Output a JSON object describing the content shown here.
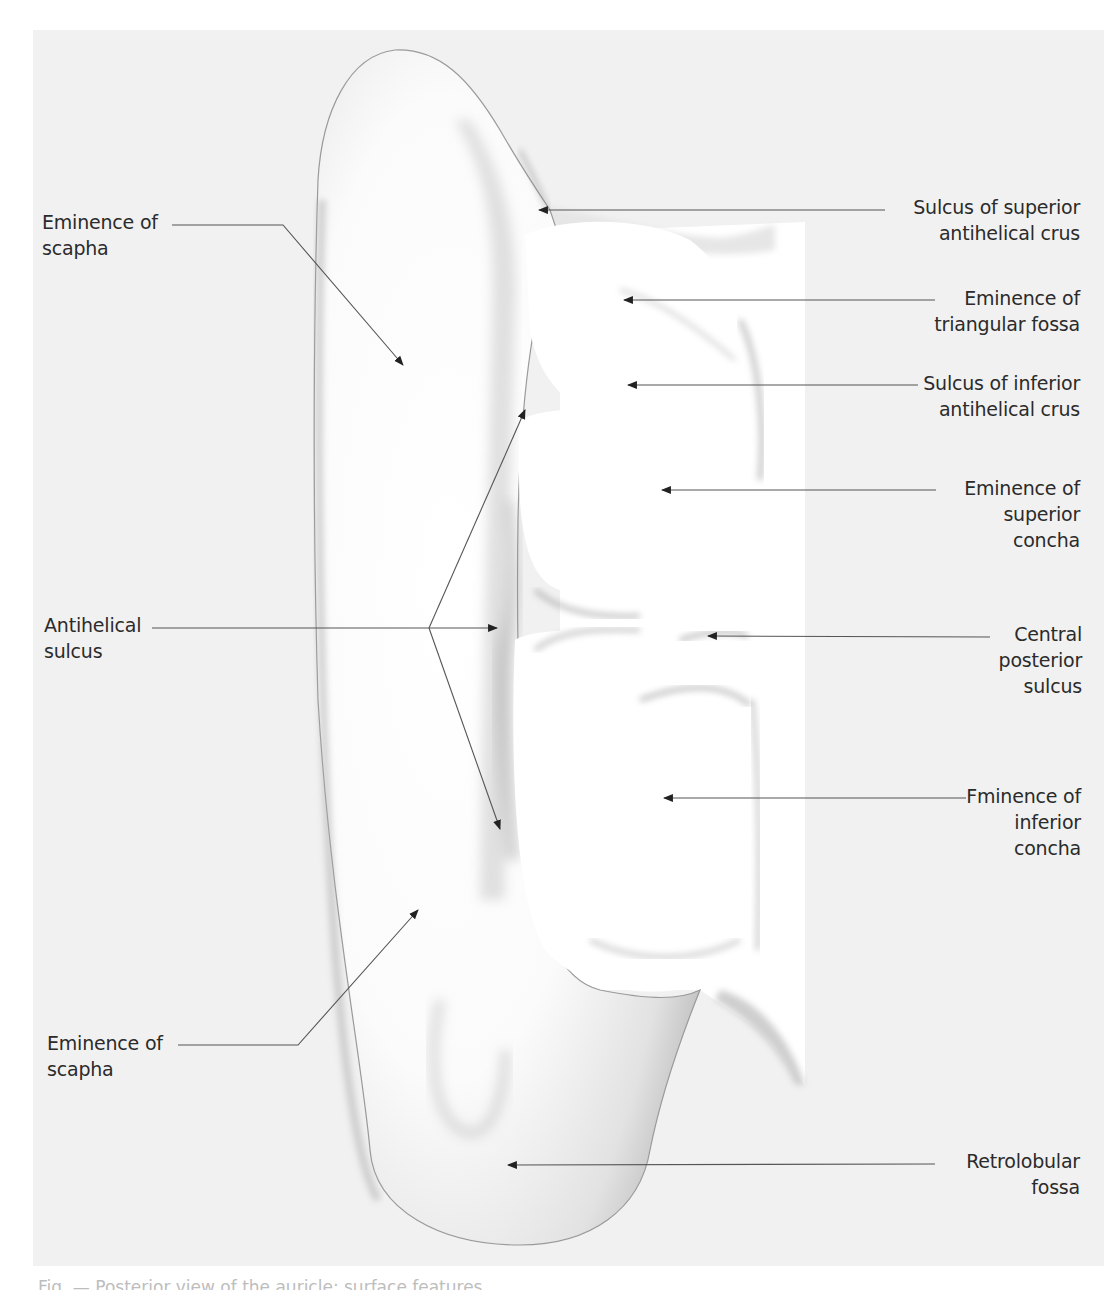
{
  "figure": {
    "background_color": "#f1f1f1",
    "label_color": "#2b2b2b",
    "leader_color": "#555555",
    "labels_left": [
      {
        "id": "eminence-of-scapha-upper",
        "lines": [
          "Eminence of",
          "scapha"
        ]
      },
      {
        "id": "antihelical-sulcus",
        "lines": [
          "Antihelical",
          "sulcus"
        ]
      },
      {
        "id": "eminence-of-scapha-lower",
        "lines": [
          "Eminence of",
          "scapha"
        ]
      }
    ],
    "labels_right": [
      {
        "id": "sulcus-superior-antihelical-crus",
        "lines": [
          "Sulcus of superior",
          "antihelical crus"
        ]
      },
      {
        "id": "eminence-triangular-fossa",
        "lines": [
          "Eminence of",
          "triangular fossa"
        ]
      },
      {
        "id": "sulcus-inferior-antihelical-crus",
        "lines": [
          "Sulcus of inferior",
          "antihelical crus"
        ]
      },
      {
        "id": "eminence-superior-concha",
        "lines": [
          "Eminence of",
          "superior",
          "concha"
        ]
      },
      {
        "id": "central-posterior-sulcus",
        "lines": [
          "Central",
          "posterior",
          "sulcus"
        ]
      },
      {
        "id": "eminence-inferior-concha",
        "lines": [
          "Fminence of",
          "inferior",
          "concha"
        ]
      },
      {
        "id": "retrolobular-fossa",
        "lines": [
          "Retrolobular",
          "fossa"
        ]
      }
    ],
    "caption": "Fig. — Posterior view of the auricle: surface features"
  }
}
